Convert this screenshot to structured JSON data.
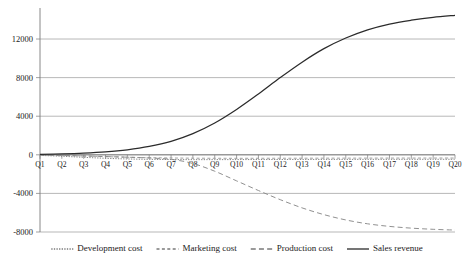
{
  "chart_data": {
    "type": "line",
    "title": "",
    "xlabel": "",
    "ylabel": "",
    "grid": true,
    "legend_position": "bottom",
    "categories": [
      "Q1",
      "Q2",
      "Q3",
      "Q4",
      "Q5",
      "Q6",
      "Q7",
      "Q8",
      "Q9",
      "Q10",
      "Q11",
      "Q12",
      "Q13",
      "Q14",
      "Q15",
      "Q16",
      "Q17",
      "Q18",
      "Q19",
      "Q20"
    ],
    "ylim": [
      -8000,
      14800
    ],
    "yticks": [
      -8000,
      -4000,
      0,
      4000,
      8000,
      12000
    ],
    "ytick_labels": [
      "-8000",
      "-4000",
      "0",
      "4000",
      "8000",
      "12000"
    ],
    "series": [
      {
        "name": "Development cost",
        "style": "dotted",
        "color": "#6f6f6f",
        "values": [
          -60,
          -150,
          -260,
          -360,
          -430,
          -470,
          -490,
          -500,
          -500,
          -495,
          -490,
          -485,
          -480,
          -478,
          -475,
          -472,
          -470,
          -468,
          -466,
          -465
        ]
      },
      {
        "name": "Marketing cost",
        "style": "dashed-short",
        "color": "#8f8f8f",
        "values": [
          -20,
          -60,
          -120,
          -190,
          -250,
          -300,
          -330,
          -350,
          -360,
          -362,
          -360,
          -356,
          -352,
          -348,
          -345,
          -342,
          -340,
          -338,
          -336,
          -335
        ]
      },
      {
        "name": "Production cost",
        "style": "dashed-long",
        "color": "#8a8a8a",
        "values": [
          -30,
          -70,
          -120,
          -180,
          -250,
          -330,
          -470,
          -900,
          -1700,
          -2700,
          -3700,
          -4650,
          -5500,
          -6200,
          -6750,
          -7150,
          -7420,
          -7600,
          -7720,
          -7800
        ]
      },
      {
        "name": "Sales revenue",
        "style": "solid",
        "color": "#2b2b2b",
        "values": [
          40,
          90,
          170,
          300,
          520,
          870,
          1400,
          2200,
          3300,
          4700,
          6300,
          8000,
          9600,
          11000,
          12100,
          12950,
          13550,
          13950,
          14250,
          14450
        ]
      }
    ]
  },
  "legend": {
    "items": [
      {
        "label": "Development cost",
        "style": "dotted"
      },
      {
        "label": "Marketing cost",
        "style": "dashed-short"
      },
      {
        "label": "Production cost",
        "style": "dashed-long"
      },
      {
        "label": "Sales revenue",
        "style": "solid"
      }
    ]
  },
  "colors": {
    "grid": "#9a9a9a",
    "axis": "#7a7a7a",
    "text": "#1a1a1a",
    "sales": "#2b2b2b",
    "production": "#8a8a8a",
    "marketing": "#8f8f8f",
    "development": "#6f6f6f"
  }
}
